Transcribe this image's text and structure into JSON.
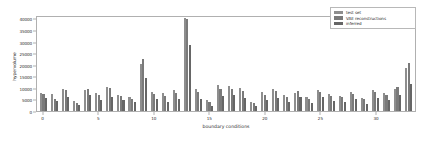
{
  "chart_data": {
    "type": "bar",
    "title": "",
    "xlabel": "boundary conditions",
    "ylabel": "hypervolume",
    "xlim": [
      -0.6,
      33.6
    ],
    "ylim": [
      0,
      41500
    ],
    "grid": false,
    "legend_position": "upper right",
    "xticks": [
      0,
      5,
      10,
      15,
      20,
      25,
      30
    ],
    "yticks": [
      0,
      5000,
      10000,
      15000,
      20000,
      25000,
      30000,
      35000,
      40000
    ],
    "categories": [
      0,
      1,
      2,
      3,
      4,
      5,
      6,
      7,
      8,
      9,
      10,
      11,
      12,
      13,
      14,
      15,
      16,
      17,
      18,
      19,
      20,
      21,
      22,
      23,
      24,
      25,
      26,
      27,
      28,
      29,
      30,
      31,
      32,
      33
    ],
    "series": [
      {
        "name": "test set",
        "color": "#8e8e8e",
        "values": [
          7800,
          7200,
          9500,
          4200,
          9000,
          7600,
          10200,
          7000,
          6200,
          20500,
          8200,
          7600,
          9200,
          40200,
          9600,
          4800,
          11200,
          11000,
          9800,
          4100,
          8400,
          9400,
          6800,
          7900,
          6100,
          9000,
          7300,
          6500,
          8200,
          5600,
          8900,
          7700,
          9600,
          18500
        ]
      },
      {
        "name": "VAE reconstructions",
        "color": "#7a7a7a",
        "values": [
          7200,
          5400,
          9100,
          3600,
          9600,
          7000,
          9800,
          6300,
          5400,
          22500,
          7200,
          6600,
          8000,
          39800,
          8200,
          3800,
          9500,
          9600,
          8800,
          3300,
          7100,
          8500,
          6000,
          8600,
          5100,
          8400,
          6400,
          5900,
          7400,
          5000,
          8200,
          7000,
          10200,
          20800
        ]
      },
      {
        "name": "inferred",
        "color": "#666666",
        "values": [
          5600,
          4300,
          6200,
          2400,
          6900,
          4800,
          6200,
          4600,
          3700,
          14400,
          5200,
          4100,
          5100,
          28500,
          5100,
          2200,
          6600,
          6800,
          5600,
          2000,
          4900,
          5500,
          3800,
          5900,
          3300,
          6000,
          4200,
          3900,
          5100,
          3200,
          5800,
          4600,
          6800,
          11600
        ]
      }
    ]
  },
  "legend": {
    "entries": [
      {
        "label": "test set"
      },
      {
        "label": "VAE reconstructions"
      },
      {
        "label": "inferred"
      }
    ]
  },
  "axes": {
    "y_label": "hypervolume",
    "x_label": "boundary conditions",
    "y_tick_labels": [
      "0",
      "5000",
      "10000",
      "15000",
      "20000",
      "25000",
      "30000",
      "35000",
      "40000"
    ],
    "x_tick_labels": [
      "0",
      "5",
      "10",
      "15",
      "20",
      "25",
      "30"
    ]
  }
}
